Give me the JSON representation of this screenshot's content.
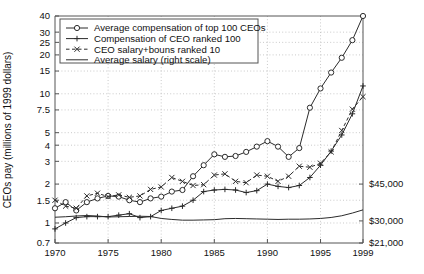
{
  "chart_data": {
    "type": "line",
    "title": "",
    "xlabel": "",
    "ylabel": "CEOs pay (millions of 1999 dollars)",
    "y2label": "",
    "yscale": "log",
    "ylim": [
      0.7,
      40
    ],
    "xlim": [
      1970,
      1999
    ],
    "grid": true,
    "legend_position": "top-left",
    "y_ticks": [
      "40",
      "30",
      "25",
      "20",
      "15",
      "10",
      "7.5",
      "5",
      "4",
      "3",
      "2",
      "1.5",
      "1",
      "0.7"
    ],
    "y_tick_values": [
      40,
      30,
      25,
      20,
      15,
      10,
      7.5,
      5,
      4,
      3,
      2,
      1.5,
      1,
      0.7
    ],
    "x_ticks": [
      "1970",
      "1975",
      "1980",
      "1985",
      "1990",
      "1995",
      "1999"
    ],
    "x_tick_values": [
      1970,
      1975,
      1980,
      1985,
      1990,
      1995,
      1999
    ],
    "y2_ticks": [
      "$45,000",
      "$30,000",
      "$21,000"
    ],
    "y2_tick_values": [
      45000,
      30000,
      21000
    ],
    "x": [
      1970,
      1971,
      1972,
      1973,
      1974,
      1975,
      1976,
      1977,
      1978,
      1979,
      1980,
      1981,
      1982,
      1983,
      1984,
      1985,
      1986,
      1987,
      1988,
      1989,
      1990,
      1991,
      1992,
      1993,
      1994,
      1995,
      1996,
      1997,
      1998,
      1999
    ],
    "series": [
      {
        "name": "Average compensation of top 100 CEOs",
        "marker": "circle",
        "linestyle": "solid",
        "values": [
          1.3,
          1.45,
          1.25,
          1.45,
          1.55,
          1.62,
          1.6,
          1.5,
          1.45,
          1.55,
          1.6,
          1.75,
          1.8,
          2.3,
          2.8,
          3.4,
          3.25,
          3.3,
          3.55,
          3.9,
          4.3,
          3.9,
          3.25,
          3.8,
          4.7,
          6.1,
          8.8,
          11.0,
          14.6,
          21.0
        ],
        "values_right_tail": [
          8.8,
          11.0,
          14.6,
          21.0,
          40.0
        ]
      },
      {
        "name": "Compensation of CEO ranked 100",
        "marker": "plus",
        "linestyle": "solid",
        "values": [
          0.9,
          1.0,
          1.1,
          1.12,
          1.12,
          1.12,
          1.15,
          1.18,
          1.1,
          1.12,
          1.25,
          1.3,
          1.35,
          1.5,
          1.75,
          1.8,
          1.82,
          1.8,
          1.72,
          1.78,
          2.0,
          1.92,
          1.88,
          1.95,
          2.25,
          2.8,
          3.6,
          4.8,
          7.0,
          11.5
        ]
      },
      {
        "name": "CEO salary+bouns ranked 10",
        "marker": "x",
        "linestyle": "dashed",
        "values": [
          1.5,
          1.35,
          1.3,
          1.62,
          1.7,
          1.6,
          1.65,
          1.58,
          1.62,
          1.82,
          1.9,
          2.25,
          2.1,
          1.95,
          1.98,
          2.35,
          2.4,
          2.1,
          2.05,
          2.35,
          2.3,
          2.1,
          2.3,
          2.75,
          2.7,
          2.9,
          3.55,
          5.2,
          7.6,
          9.5
        ]
      },
      {
        "name": "Average salary (right scale)",
        "marker": "none",
        "linestyle": "solid",
        "right_axis": true,
        "values_usd": [
          31500,
          31700,
          32000,
          32200,
          32000,
          31600,
          31700,
          31800,
          31900,
          31800,
          31000,
          30600,
          30300,
          30300,
          30400,
          30500,
          30900,
          31000,
          30900,
          30800,
          30700,
          30600,
          30700,
          30700,
          30800,
          31000,
          31400,
          32100,
          33200,
          34500
        ]
      }
    ]
  },
  "legend": {
    "entries": [
      {
        "label": "Average compensation of top 100 CEOs",
        "marker": "circle",
        "linestyle": "solid"
      },
      {
        "label": "Compensation of CEO ranked 100",
        "marker": "plus",
        "linestyle": "solid"
      },
      {
        "label": "CEO salary+bouns ranked 10",
        "marker": "x",
        "linestyle": "dashed"
      },
      {
        "label": "Average salary (right scale)",
        "marker": "none",
        "linestyle": "solid"
      }
    ]
  }
}
